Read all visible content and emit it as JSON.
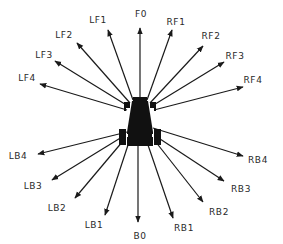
{
  "diagram": {
    "title": "",
    "colors": {
      "ink": "#1a1a1a",
      "label": "#2a2a2a",
      "background": "#ffffff"
    },
    "origin": {
      "x": 140,
      "y": 122
    },
    "arrows": [
      {
        "id": "F0",
        "label": "F0",
        "from": [
          140,
          98
        ],
        "tip": [
          140,
          28
        ],
        "label_pos": [
          141,
          14
        ]
      },
      {
        "id": "RF1",
        "label": "RF1",
        "from": [
          147,
          100
        ],
        "tip": [
          172,
          30
        ],
        "label_pos": [
          176,
          22
        ]
      },
      {
        "id": "RF2",
        "label": "RF2",
        "from": [
          150,
          103
        ],
        "tip": [
          203,
          46
        ],
        "label_pos": [
          211,
          36
        ]
      },
      {
        "id": "RF3",
        "label": "RF3",
        "from": [
          152,
          106
        ],
        "tip": [
          224,
          62
        ],
        "label_pos": [
          235,
          56
        ]
      },
      {
        "id": "RF4",
        "label": "RF4",
        "from": [
          154,
          110
        ],
        "tip": [
          243,
          87
        ],
        "label_pos": [
          253,
          80
        ]
      },
      {
        "id": "LF1",
        "label": "LF1",
        "from": [
          133,
          100
        ],
        "tip": [
          108,
          30
        ],
        "label_pos": [
          98,
          20
        ]
      },
      {
        "id": "LF2",
        "label": "LF2",
        "from": [
          130,
          103
        ],
        "tip": [
          77,
          43
        ],
        "label_pos": [
          64,
          35
        ]
      },
      {
        "id": "LF3",
        "label": "LF3",
        "from": [
          128,
          106
        ],
        "tip": [
          55,
          61
        ],
        "label_pos": [
          44,
          55
        ]
      },
      {
        "id": "LF4",
        "label": "LF4",
        "from": [
          127,
          110
        ],
        "tip": [
          40,
          84
        ],
        "label_pos": [
          27,
          78
        ]
      },
      {
        "id": "LB4",
        "label": "LB4",
        "from": [
          127,
          132
        ],
        "tip": [
          38,
          154
        ],
        "label_pos": [
          18,
          156
        ]
      },
      {
        "id": "LB3",
        "label": "LB3",
        "from": [
          122,
          137
        ],
        "tip": [
          52,
          180
        ],
        "label_pos": [
          33,
          186
        ]
      },
      {
        "id": "LB2",
        "label": "LB2",
        "from": [
          123,
          141
        ],
        "tip": [
          75,
          198
        ],
        "label_pos": [
          57,
          208
        ]
      },
      {
        "id": "LB1",
        "label": "LB1",
        "from": [
          128,
          145
        ],
        "tip": [
          105,
          215
        ],
        "label_pos": [
          94,
          225
        ]
      },
      {
        "id": "B0",
        "label": "B0",
        "from": [
          138,
          146
        ],
        "tip": [
          138,
          222
        ],
        "label_pos": [
          140,
          236
        ]
      },
      {
        "id": "RB1",
        "label": "RB1",
        "from": [
          148,
          145
        ],
        "tip": [
          173,
          218
        ],
        "label_pos": [
          184,
          228
        ]
      },
      {
        "id": "RB2",
        "label": "RB2",
        "from": [
          155,
          141
        ],
        "tip": [
          203,
          202
        ],
        "label_pos": [
          219,
          212
        ]
      },
      {
        "id": "RB3",
        "label": "RB3",
        "from": [
          157,
          137
        ],
        "tip": [
          224,
          181
        ],
        "label_pos": [
          241,
          189
        ]
      },
      {
        "id": "RB4",
        "label": "RB4",
        "from": [
          153,
          128
        ],
        "tip": [
          243,
          156
        ],
        "label_pos": [
          258,
          160
        ]
      }
    ],
    "robot": {
      "body": "trapezoid",
      "top_width": 16,
      "bottom_width": 28,
      "top_y": 98,
      "bottom_y": 146,
      "center_x": 140
    }
  }
}
